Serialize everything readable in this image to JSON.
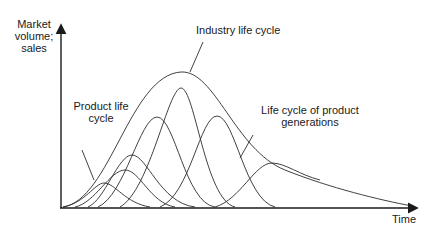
{
  "diagram": {
    "y_axis_label": "Market volume; sales",
    "y_axis_lines": [
      "Market",
      "volume;",
      "sales"
    ],
    "x_axis_label": "Time",
    "annotations": {
      "industry": "Industry life cycle",
      "product_line1": "Product life",
      "product_line2": "cycle",
      "generations_line1": "Life cycle of product",
      "generations_line2": "generations"
    },
    "stroke_color": "#2b2b2b",
    "curves": {
      "industry": "M63,207 C110,200 130,75 181,72 C215,70 235,150 285,170 C330,188 380,200 412,206",
      "products": [
        "M63,207 C85,203 95,183 104,183 C115,183 125,203 150,207",
        "M75,207 C95,203 110,170 125,170 C140,170 150,203 175,207",
        "M88,207 C105,200 118,155 132,155 C147,155 160,203 195,207",
        "M98,207 C125,195 140,117 157,117 C175,117 185,203 215,207",
        "M120,207 C150,190 168,88 181,88 C195,88 205,200 235,207",
        "M160,207 C190,195 200,116 217,116 C235,116 245,200 275,207",
        "M215,207 C240,200 255,163 272,163 C285,163 300,175 320,180"
      ]
    }
  }
}
